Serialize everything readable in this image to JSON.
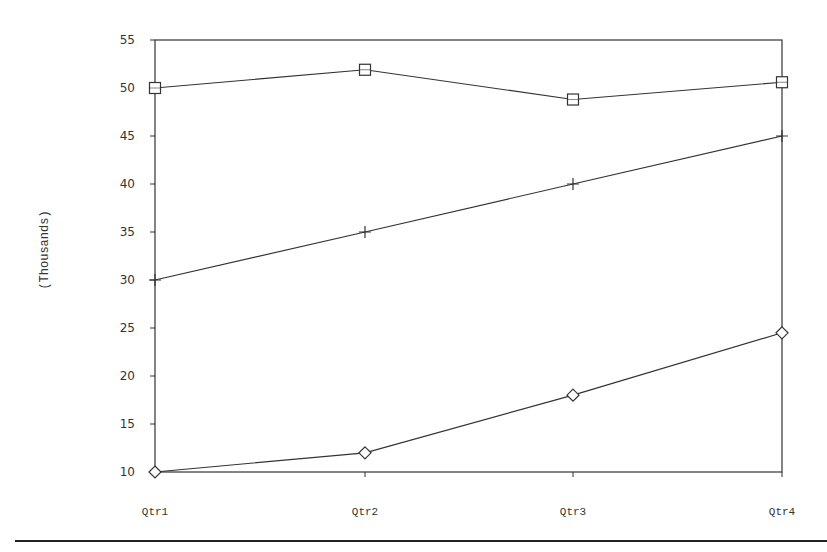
{
  "chart_data": {
    "type": "line",
    "title": "",
    "xlabel": "",
    "ylabel": "(Thousands)",
    "categories": [
      "Qtr1",
      "Qtr2",
      "Qtr3",
      "Qtr4"
    ],
    "series": [
      {
        "name": "Series 1",
        "marker": "square",
        "values": [
          50,
          51.9,
          48.8,
          50.6
        ]
      },
      {
        "name": "Series 2",
        "marker": "plus",
        "values": [
          30,
          35,
          40,
          45
        ]
      },
      {
        "name": "Series 3",
        "marker": "diamond",
        "values": [
          10,
          12,
          18,
          24.5
        ]
      }
    ],
    "ylim": [
      10,
      55
    ],
    "yticks": [
      10,
      15,
      20,
      25,
      30,
      35,
      40,
      45,
      50,
      55
    ],
    "grid": false,
    "legend": "none"
  },
  "layout": {
    "plot_left": 155,
    "plot_right": 782,
    "plot_top": 40,
    "plot_bottom": 472,
    "category_x": [
      155,
      365,
      573,
      782
    ]
  }
}
